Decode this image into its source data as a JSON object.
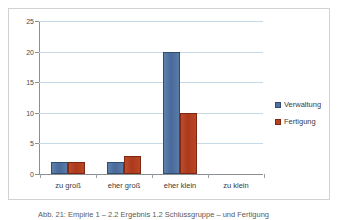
{
  "chart_data": {
    "type": "bar",
    "title": "",
    "subtitle": "",
    "xlabel": "",
    "ylabel": "",
    "categories": [
      "zu groß",
      "eher groß",
      "eher klein",
      "zu klein"
    ],
    "series": [
      {
        "name": "Verwaltung",
        "color": "#4F729F",
        "values": [
          2,
          2,
          20,
          0
        ]
      },
      {
        "name": "Fertigung",
        "color": "#B4411F",
        "values": [
          2,
          3,
          10,
          0
        ]
      }
    ],
    "ylim": [
      0,
      25
    ],
    "ytick_values": [
      0,
      5,
      10,
      15,
      20,
      25
    ],
    "ytick_labels": [
      "0",
      "5",
      "10",
      "15",
      "20",
      "25"
    ],
    "grid": "horizontal",
    "legend_position": "right",
    "annotations": []
  },
  "caption": {
    "text": "Abb. 21: Empirie 1 – 2.2 Ergebnis 1.2 Schlussgruppe – und Fertigung"
  }
}
